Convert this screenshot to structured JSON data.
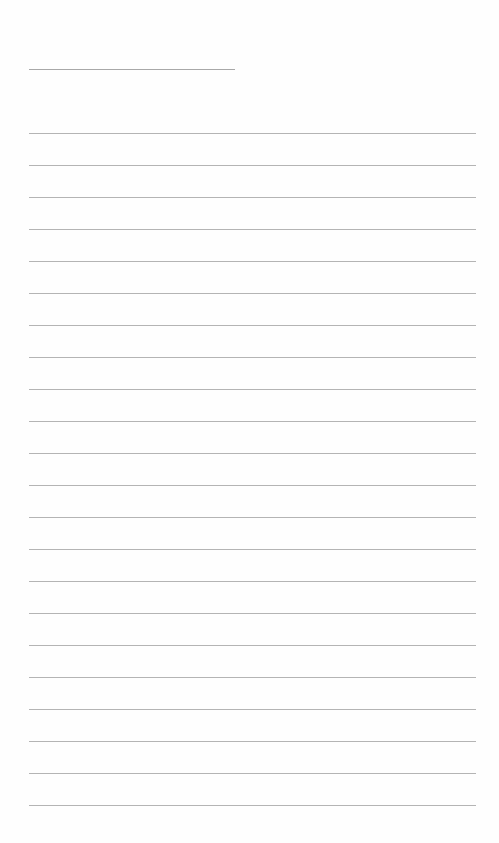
{
  "page": {
    "type": "lined-paper",
    "background_color": "#fefefe",
    "line_color": "#b4b4b4",
    "title_line": {
      "x": 29,
      "y": 69,
      "width": 206,
      "text": ""
    },
    "rules": {
      "count": 22,
      "x": 29,
      "first_y": 133,
      "spacing": 32,
      "width": 447,
      "lines": [
        "",
        "",
        "",
        "",
        "",
        "",
        "",
        "",
        "",
        "",
        "",
        "",
        "",
        "",
        "",
        "",
        "",
        "",
        "",
        "",
        "",
        ""
      ]
    }
  }
}
